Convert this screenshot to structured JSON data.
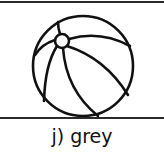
{
  "item": {
    "label": "j) grey",
    "picture": "beach-ball",
    "line_color": "#111111"
  }
}
